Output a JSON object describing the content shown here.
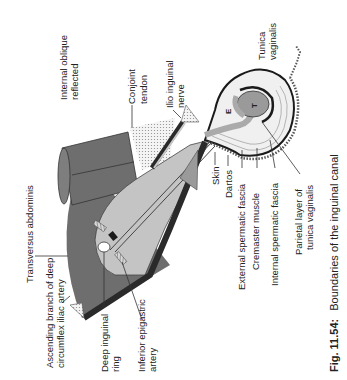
{
  "figure": {
    "caption_number": "Fig. 11.54:",
    "caption_text": "Boundaries of the inguinal canal",
    "orientation": "rotated 90° counter-clockwise"
  },
  "labels": {
    "internal_oblique_1": "Internal oblique",
    "internal_oblique_2": "reflected",
    "conjoint_1": "Conjoint",
    "conjoint_2": "tendon",
    "ilio_inguinal_1": "Ilio inguinal",
    "ilio_inguinal_2": "nerve",
    "tunica_vaginalis_1": "Tunica",
    "tunica_vaginalis_2": "vaginalis",
    "transversus": "Transversus abdominis",
    "ascending_1": "Ascending branch of deep",
    "ascending_2": "circumflex iliac artery",
    "deep_ring_1": "Deep inguinal",
    "deep_ring_2": "ring",
    "inferior_epigastric_1": "Inferior epigastric",
    "inferior_epigastric_2": "artery",
    "skin": "Skin",
    "dartos": "Dartos",
    "external_spermatic": "External spermatic fascia",
    "cremaster": "Cremaster muscle",
    "internal_spermatic": "Internal spermatic fascia",
    "parietal_1": "Parietal layer of",
    "parietal_2": "tunica vaginalis",
    "testis_letter": "T",
    "epididymis_letter": "E"
  },
  "colors": {
    "muscle_dark": "#6e6e6e",
    "muscle_mid": "#8a8a8a",
    "canal_light": "#c4c4c4",
    "ligament_black": "#2a2a2a",
    "dotted_area": "#e6e6e6",
    "testis_fill": "#9a9a9a"
  }
}
